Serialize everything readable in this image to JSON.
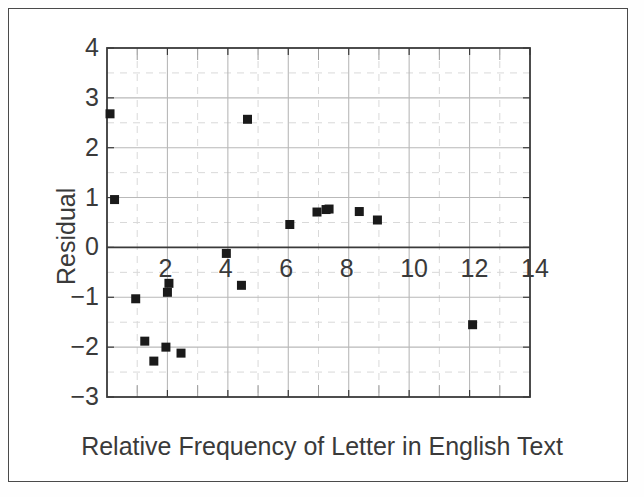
{
  "figure": {
    "background_color": "#ffffff",
    "frame_color": "#4a4a4a",
    "axis_color": "#3a3a3a",
    "marker_color": "#1a1a1a",
    "major_grid_color": "#b9b9b9",
    "minor_grid_color": "#d9d9d9"
  },
  "chart_data": {
    "type": "scatter",
    "title": "",
    "xlabel": "Relative Frequency of Letter in English Text",
    "ylabel": "Residual",
    "xlim": [
      0,
      14
    ],
    "ylim": [
      -3,
      4
    ],
    "xticks": [
      2,
      4,
      6,
      8,
      10,
      12,
      14
    ],
    "xtick_labels": [
      "2",
      "4",
      "6",
      "8",
      "10",
      "12",
      "14"
    ],
    "yticks": [
      4,
      3,
      2,
      1,
      0,
      -1,
      -2,
      -3
    ],
    "ytick_labels": [
      "4",
      "3",
      "2",
      "1",
      "0",
      "−1",
      "−2",
      "−3"
    ],
    "x_minor_ticks": [
      1,
      3,
      5,
      7,
      9,
      11,
      13
    ],
    "y_minor_ticks": [
      3.5,
      2.5,
      1.5,
      0.5,
      -0.5,
      -1.5,
      -2.5
    ],
    "grid": true,
    "grid_style": "major solid, minor dashed",
    "legend": "none",
    "zero_line": 0,
    "marker_shape": "square",
    "marker_size_px": 9,
    "points": [
      {
        "x": 0.1,
        "y": 2.68
      },
      {
        "x": 0.25,
        "y": 0.96
      },
      {
        "x": 0.95,
        "y": -1.03
      },
      {
        "x": 1.25,
        "y": -1.88
      },
      {
        "x": 1.55,
        "y": -2.28
      },
      {
        "x": 1.95,
        "y": -2.0
      },
      {
        "x": 2.05,
        "y": -0.72
      },
      {
        "x": 2.0,
        "y": -0.9
      },
      {
        "x": 2.45,
        "y": -2.12
      },
      {
        "x": 3.95,
        "y": -0.12
      },
      {
        "x": 4.45,
        "y": -0.76
      },
      {
        "x": 4.65,
        "y": 2.57
      },
      {
        "x": 6.05,
        "y": 0.46
      },
      {
        "x": 6.95,
        "y": 0.71
      },
      {
        "x": 7.25,
        "y": 0.76
      },
      {
        "x": 7.35,
        "y": 0.77
      },
      {
        "x": 8.35,
        "y": 0.72
      },
      {
        "x": 8.95,
        "y": 0.55
      },
      {
        "x": 12.1,
        "y": -1.55
      }
    ]
  }
}
